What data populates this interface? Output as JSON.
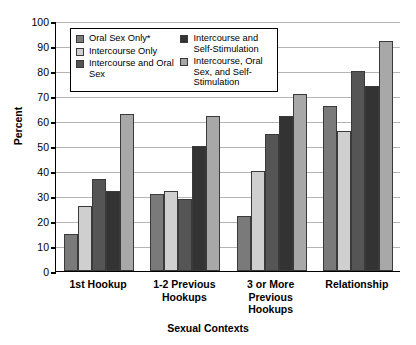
{
  "chart_data": {
    "type": "bar",
    "title": "",
    "xlabel": "Sexual Contexts",
    "ylabel": "Percent",
    "ylim": [
      0,
      100
    ],
    "ytick_step": 10,
    "yticks": [
      0,
      10,
      20,
      30,
      40,
      50,
      60,
      70,
      80,
      90,
      100
    ],
    "grid": true,
    "legend_position": "upper-left-inside",
    "categories": [
      "1st Hookup",
      "1-2 Previous Hookups",
      "3 or More Previous Hookups",
      "Relationship"
    ],
    "series": [
      {
        "name": "Oral Sex Only*",
        "color": "#7a7a7a",
        "values": [
          15,
          31,
          22,
          66
        ]
      },
      {
        "name": "Intercourse Only",
        "color": "#cfcfcf",
        "values": [
          26,
          32,
          40,
          56
        ]
      },
      {
        "name": "Intercourse and Oral Sex",
        "color": "#555555",
        "values": [
          37,
          29,
          55,
          80
        ]
      },
      {
        "name": "Intercourse and Self-Stimulation",
        "color": "#333333",
        "values": [
          32,
          50,
          62,
          74
        ]
      },
      {
        "name": "Intercourse, Oral Sex, and Self-Stimulation",
        "color": "#a8a8a8",
        "values": [
          63,
          62,
          71,
          92
        ]
      }
    ]
  },
  "legend": {
    "columns": [
      [
        "Oral Sex Only*",
        "Intercourse Only",
        "Intercourse and Oral Sex"
      ],
      [
        "Intercourse and Self-Stimulation",
        "Intercourse, Oral Sex, and Self-Stimulation"
      ]
    ]
  },
  "axis": {
    "y_title": "Percent",
    "x_title": "Sexual Contexts"
  }
}
